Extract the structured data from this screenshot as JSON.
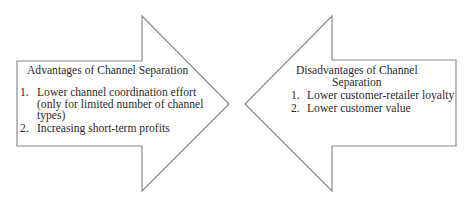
{
  "diagram": {
    "left_arrow": {
      "direction": "right",
      "title": "Advantages of Channel Separation",
      "items": [
        {
          "number": "1.",
          "lines": [
            "Lower channel coordination effort",
            "(only for limited number of channel",
            "types)"
          ]
        },
        {
          "number": "2.",
          "lines": [
            "Increasing short-term profits"
          ]
        }
      ]
    },
    "right_arrow": {
      "direction": "left",
      "title_lines": [
        "Disadvantages of Channel",
        "Separation"
      ],
      "items": [
        {
          "number": "1.",
          "lines": [
            "Lower customer-retailer loyalty"
          ]
        },
        {
          "number": "2.",
          "lines": [
            "Lower customer value"
          ]
        }
      ]
    },
    "colors": {
      "outline": "#8a8a8a",
      "text": "#2a2a2a",
      "background": "#ffffff"
    }
  }
}
